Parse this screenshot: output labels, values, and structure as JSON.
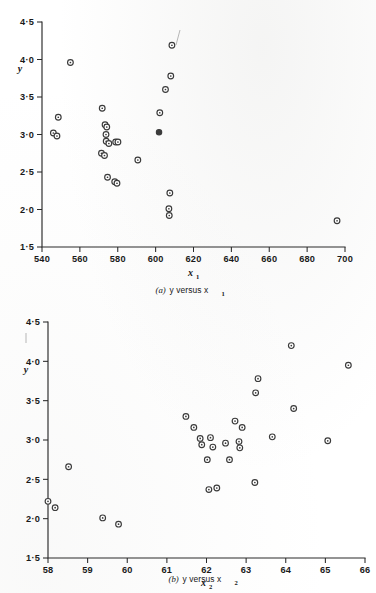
{
  "page": {
    "background_color": "#ffffff",
    "ink_color": "#2a2a2a",
    "marker_color": "#3a3a3a"
  },
  "chart_data": [
    {
      "id": "a",
      "type": "scatter",
      "title": "",
      "caption_prefix": "(a)",
      "caption_text": "y versus x",
      "caption_subscript": "1",
      "xlabel": "x",
      "xlabel_subscript": "1",
      "ylabel": "y",
      "xlim": [
        540,
        700
      ],
      "ylim": [
        1.5,
        4.5
      ],
      "xticks": [
        540,
        560,
        580,
        600,
        620,
        640,
        660,
        680,
        700
      ],
      "xtick_labels": [
        "540",
        "560",
        "580",
        "600",
        "620",
        "640",
        "660",
        "680",
        "700"
      ],
      "yticks": [
        1.5,
        2.0,
        2.5,
        3.0,
        3.5,
        4.0,
        4.5
      ],
      "ytick_labels": [
        "1·5",
        "2·0",
        "2·5",
        "3·0",
        "3·5",
        "4·0",
        "4·5"
      ],
      "grid": false,
      "legend": "none",
      "marker_style": "open-circle-with-dot",
      "points": [
        {
          "x": 546.0,
          "y": 3.02,
          "filled": false
        },
        {
          "x": 547.9,
          "y": 2.98,
          "filled": false
        },
        {
          "x": 548.6,
          "y": 3.23,
          "filled": false
        },
        {
          "x": 555.0,
          "y": 3.96,
          "filled": false
        },
        {
          "x": 571.8,
          "y": 3.35,
          "filled": false
        },
        {
          "x": 573.3,
          "y": 3.13,
          "filled": false
        },
        {
          "x": 574.2,
          "y": 3.1,
          "filled": false
        },
        {
          "x": 573.8,
          "y": 3.0,
          "filled": false
        },
        {
          "x": 573.9,
          "y": 2.91,
          "filled": false
        },
        {
          "x": 575.3,
          "y": 2.88,
          "filled": false
        },
        {
          "x": 578.9,
          "y": 2.9,
          "filled": false
        },
        {
          "x": 580.1,
          "y": 2.9,
          "filled": false
        },
        {
          "x": 571.4,
          "y": 2.75,
          "filled": false
        },
        {
          "x": 573.0,
          "y": 2.72,
          "filled": false
        },
        {
          "x": 574.6,
          "y": 2.43,
          "filled": false
        },
        {
          "x": 578.4,
          "y": 2.37,
          "filled": false
        },
        {
          "x": 579.6,
          "y": 2.35,
          "filled": false
        },
        {
          "x": 590.6,
          "y": 2.66,
          "filled": false
        },
        {
          "x": 601.8,
          "y": 3.03,
          "filled": true
        },
        {
          "x": 602.2,
          "y": 3.29,
          "filled": false
        },
        {
          "x": 605.2,
          "y": 3.6,
          "filled": false
        },
        {
          "x": 608.0,
          "y": 3.78,
          "filled": false
        },
        {
          "x": 608.6,
          "y": 4.19,
          "filled": false
        },
        {
          "x": 607.5,
          "y": 2.22,
          "filled": false
        },
        {
          "x": 607.0,
          "y": 2.01,
          "filled": false
        },
        {
          "x": 607.2,
          "y": 1.92,
          "filled": false
        },
        {
          "x": 695.8,
          "y": 1.85,
          "filled": false
        }
      ]
    },
    {
      "id": "b",
      "type": "scatter",
      "title": "",
      "caption_prefix": "(b)",
      "caption_text": "y versus x",
      "caption_subscript": "2",
      "xlabel": "x",
      "xlabel_subscript": "2",
      "ylabel": "y",
      "xlim": [
        58,
        66
      ],
      "ylim": [
        1.5,
        4.5
      ],
      "xticks": [
        58,
        59,
        60,
        61,
        62,
        63,
        64,
        65,
        66
      ],
      "xtick_labels": [
        "58",
        "59",
        "60",
        "61",
        "62",
        "63",
        "64",
        "65",
        "66"
      ],
      "yticks": [
        1.5,
        2.0,
        2.5,
        3.0,
        3.5,
        4.0,
        4.5
      ],
      "ytick_labels": [
        "1·5",
        "2·0",
        "2·5",
        "3·0",
        "3·5",
        "4·0",
        "4·5"
      ],
      "grid": false,
      "legend": "none",
      "marker_style": "open-circle-with-dot",
      "points": [
        {
          "x": 58.0,
          "y": 2.22,
          "filled": false
        },
        {
          "x": 58.18,
          "y": 2.14,
          "filled": false
        },
        {
          "x": 58.52,
          "y": 2.66,
          "filled": false
        },
        {
          "x": 59.38,
          "y": 2.01,
          "filled": false
        },
        {
          "x": 59.78,
          "y": 1.93,
          "filled": false
        },
        {
          "x": 61.48,
          "y": 3.3,
          "filled": false
        },
        {
          "x": 61.68,
          "y": 3.16,
          "filled": false
        },
        {
          "x": 61.84,
          "y": 3.02,
          "filled": false
        },
        {
          "x": 61.88,
          "y": 2.94,
          "filled": false
        },
        {
          "x": 62.02,
          "y": 2.75,
          "filled": false
        },
        {
          "x": 62.1,
          "y": 3.03,
          "filled": false
        },
        {
          "x": 62.16,
          "y": 2.91,
          "filled": false
        },
        {
          "x": 62.06,
          "y": 2.37,
          "filled": false
        },
        {
          "x": 62.26,
          "y": 2.39,
          "filled": false
        },
        {
          "x": 62.48,
          "y": 2.96,
          "filled": false
        },
        {
          "x": 62.58,
          "y": 2.75,
          "filled": false
        },
        {
          "x": 62.72,
          "y": 3.24,
          "filled": false
        },
        {
          "x": 62.82,
          "y": 2.98,
          "filled": false
        },
        {
          "x": 62.84,
          "y": 2.9,
          "filled": false
        },
        {
          "x": 62.9,
          "y": 3.16,
          "filled": false
        },
        {
          "x": 63.22,
          "y": 2.46,
          "filled": false
        },
        {
          "x": 63.24,
          "y": 3.6,
          "filled": false
        },
        {
          "x": 63.3,
          "y": 3.78,
          "filled": false
        },
        {
          "x": 63.66,
          "y": 3.04,
          "filled": false
        },
        {
          "x": 64.14,
          "y": 4.2,
          "filled": false
        },
        {
          "x": 64.2,
          "y": 3.4,
          "filled": false
        },
        {
          "x": 65.06,
          "y": 2.99,
          "filled": false
        },
        {
          "x": 65.58,
          "y": 3.95,
          "filled": false
        }
      ]
    }
  ]
}
